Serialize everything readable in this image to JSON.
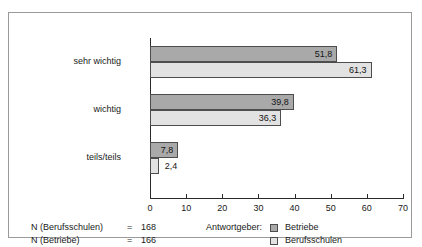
{
  "chart_data": {
    "type": "bar",
    "orientation": "horizontal",
    "title": "",
    "xlabel": "",
    "ylabel": "",
    "categories": [
      "sehr wichtig",
      "wichtig",
      "teils/teils"
    ],
    "series": [
      {
        "name": "Betriebe",
        "color": "#a9a9a9",
        "values": [
          51.8,
          39.8,
          7.8
        ],
        "labels": [
          "51,8",
          "39,8",
          "7,8"
        ]
      },
      {
        "name": "Berufsschulen",
        "color": "#e2e2e2",
        "values": [
          61.3,
          36.3,
          2.4
        ],
        "labels": [
          "61,3",
          "36,3",
          "2,4"
        ]
      }
    ],
    "xlim": [
      0,
      70
    ],
    "xticks": [
      0,
      10,
      20,
      30,
      40,
      50,
      60,
      70
    ],
    "xtick_labels": [
      "0",
      "10",
      "20",
      "30",
      "40",
      "50",
      "60",
      "70"
    ],
    "grid": false,
    "legend_position": "bottom-center"
  },
  "legend": {
    "title": "Antwortgeber:",
    "items": [
      {
        "label": "Betriebe",
        "color": "#a9a9a9"
      },
      {
        "label": "Berufsschulen",
        "color": "#e2e2e2"
      }
    ]
  },
  "notes": [
    {
      "key": "N (Berufsschulen)",
      "eq": "=",
      "value": "168"
    },
    {
      "key": "N (Betriebe)",
      "eq": "=",
      "value": "166"
    }
  ],
  "colors": {
    "series_betriebe": "#a9a9a9",
    "series_berufsschulen": "#e2e2e2",
    "bar_border": "#4d4d4d",
    "axis": "#2a2a2a",
    "frame": "#9a9a9a",
    "background": "#ffffff"
  }
}
